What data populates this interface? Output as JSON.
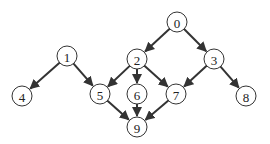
{
  "diagram": {
    "type": "directed-graph",
    "node_radius": 10,
    "colors": {
      "stroke": "#333333",
      "fill": "#ffffff",
      "text": "#222222"
    },
    "nodes": [
      {
        "id": "0",
        "label": "0",
        "x": 177,
        "y": 22
      },
      {
        "id": "1",
        "label": "1",
        "x": 67,
        "y": 56
      },
      {
        "id": "2",
        "label": "2",
        "x": 137,
        "y": 59
      },
      {
        "id": "3",
        "label": "3",
        "x": 214,
        "y": 59
      },
      {
        "id": "4",
        "label": "4",
        "x": 22,
        "y": 96
      },
      {
        "id": "5",
        "label": "5",
        "x": 100,
        "y": 94
      },
      {
        "id": "6",
        "label": "6",
        "x": 137,
        "y": 94
      },
      {
        "id": "7",
        "label": "7",
        "x": 176,
        "y": 94
      },
      {
        "id": "8",
        "label": "8",
        "x": 246,
        "y": 96
      },
      {
        "id": "9",
        "label": "9",
        "x": 137,
        "y": 127
      }
    ],
    "edges": [
      {
        "from": "0",
        "to": "2"
      },
      {
        "from": "0",
        "to": "3"
      },
      {
        "from": "1",
        "to": "4"
      },
      {
        "from": "1",
        "to": "5"
      },
      {
        "from": "2",
        "to": "5"
      },
      {
        "from": "2",
        "to": "6"
      },
      {
        "from": "2",
        "to": "7"
      },
      {
        "from": "3",
        "to": "7"
      },
      {
        "from": "3",
        "to": "8"
      },
      {
        "from": "5",
        "to": "9"
      },
      {
        "from": "6",
        "to": "9"
      },
      {
        "from": "7",
        "to": "9"
      }
    ]
  }
}
